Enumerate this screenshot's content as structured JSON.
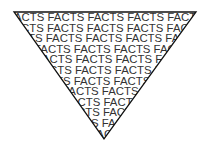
{
  "figure": {
    "word": "FACTS",
    "rows": [
      "ACTS FACTS FACTS FACTS FACTS FACTS",
      "CTS FACTS FACTS FACTS FACTS FACTS",
      "TS FACTS FACTS FACTS FACTS FACTS",
      "FACTS FACTS FACTS FACTS FACTS",
      "ACTS FACTS FACTS FACTS FACTS",
      "CTS FACTS FACTS FACTS FACTS",
      "TS FACTS FACTS FACTS FACTS",
      "FACTS FACTS FACTS FACTS",
      "ACTS FACTS FACTS FACTS",
      "CTS FACTS FACTS FACTS",
      "TS FACTS FACTS FACTS",
      "FACTS FACTS FACTS"
    ],
    "shape": "inverted-triangle",
    "colors": {
      "text": "#333333",
      "outline": "#111111",
      "background": "#ffffff"
    }
  }
}
